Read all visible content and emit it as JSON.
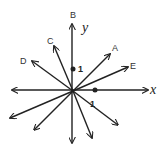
{
  "diagram": {
    "axes": {
      "x_label": "x",
      "y_label": "y",
      "x_unit_label": "1",
      "y_unit_label": "1"
    },
    "vectors": [
      {
        "label": "A",
        "tip": [
          110,
          54
        ]
      },
      {
        "label": "B",
        "tip": [
          72,
          24
        ]
      },
      {
        "label": "C",
        "tip": [
          54,
          46
        ]
      },
      {
        "label": "D",
        "tip": [
          32,
          61
        ]
      },
      {
        "label": "E",
        "tip": [
          128,
          67
        ]
      }
    ],
    "unlabeled_vectors": [
      {
        "tip": [
          10,
          118
        ]
      },
      {
        "tip": [
          34,
          130
        ]
      },
      {
        "tip": [
          118,
          125
        ]
      },
      {
        "tip": [
          92,
          138
        ]
      }
    ],
    "colors": {
      "line": "#222222",
      "background": "#ffffff"
    }
  }
}
